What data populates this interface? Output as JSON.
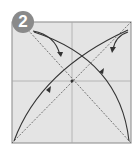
{
  "step": {
    "number": "2",
    "badge_color": "#8a8a8a"
  },
  "paper": {
    "fill": "#e4e4e4",
    "border": "#9a9a9a"
  },
  "lines": {
    "crease_color": "#a8a8a8",
    "diagonal_color": "#555555",
    "arrow_color": "#333333"
  },
  "icons": [
    "step-number-badge",
    "fold-arrow",
    "valley-fold-line",
    "crease-line"
  ]
}
